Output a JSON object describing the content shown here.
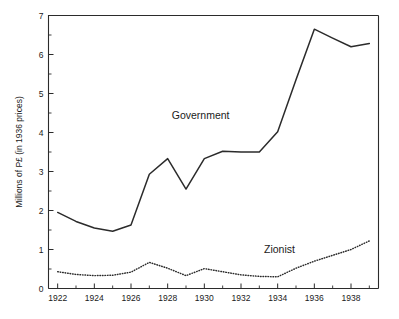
{
  "chart_data": {
    "type": "line",
    "title": "",
    "subtitle": "",
    "xlabel": "",
    "ylabel": "Millions of P£ (in 1936 prices)",
    "xlim": [
      1921.5,
      1939.5
    ],
    "ylim": [
      0,
      7
    ],
    "grid": false,
    "legend_position": "inline-annotations",
    "x_major_ticks": [
      1922,
      1924,
      1926,
      1928,
      1930,
      1932,
      1934,
      1936,
      1938
    ],
    "x_major_tick_labels": [
      "1922",
      "1924",
      "1926",
      "1928",
      "1930",
      "1932",
      "1934",
      "1936",
      "1938"
    ],
    "x_minor_ticks": [
      1923,
      1925,
      1927,
      1929,
      1931,
      1933,
      1935,
      1937,
      1939
    ],
    "y_major_ticks": [
      0,
      1,
      2,
      3,
      4,
      5,
      6,
      7
    ],
    "y_major_tick_labels": [
      "0",
      "1",
      "2",
      "3",
      "4",
      "5",
      "6",
      "7"
    ],
    "y_minor_ticks": [
      0.5,
      1.5,
      2.5,
      3.5,
      4.5,
      5.5,
      6.5
    ],
    "x": [
      1922,
      1923,
      1924,
      1925,
      1926,
      1927,
      1928,
      1929,
      1930,
      1931,
      1932,
      1933,
      1934,
      1935,
      1936,
      1937,
      1938,
      1939
    ],
    "series": [
      {
        "name": "Government",
        "style": "solid",
        "color": "#2b2b2b",
        "values": [
          1.95,
          1.72,
          1.55,
          1.47,
          1.63,
          2.93,
          3.33,
          2.55,
          3.33,
          3.52,
          3.5,
          3.5,
          4.02,
          5.35,
          6.65,
          6.42,
          6.2,
          6.28
        ]
      },
      {
        "name": "Zionist",
        "style": "dotted",
        "color": "#2b2b2b",
        "values": [
          0.43,
          0.36,
          0.33,
          0.34,
          0.42,
          0.67,
          0.52,
          0.33,
          0.51,
          0.43,
          0.35,
          0.31,
          0.3,
          0.52,
          0.7,
          0.85,
          1.0,
          1.22
        ]
      }
    ],
    "annotations": [
      {
        "text": "Government",
        "x": 1929.8,
        "y": 4.35
      },
      {
        "text": "Zionist",
        "x": 1934.1,
        "y": 0.92
      }
    ]
  },
  "axis": {
    "y_title": "Millions of P£ (in 1936 prices)"
  },
  "labels": {
    "government": "Government",
    "zionist": "Zionist"
  },
  "colors": {
    "line": "#2b2b2b",
    "axis": "#2b2b2b",
    "text": "#1a1a1a",
    "background": "#ffffff"
  }
}
